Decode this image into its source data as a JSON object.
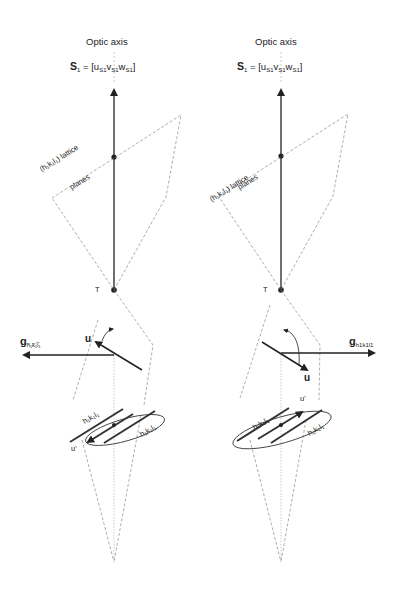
{
  "panels": [
    {
      "id": "left",
      "title": "Optic axis",
      "vector_label": "S",
      "vector_sub": "1",
      "equation": "= [u",
      "eq_parts": [
        "u",
        "S1",
        "v",
        "S1",
        "w",
        "S1"
      ],
      "lattice_label": "(h₁k₁l₁) lattice",
      "lattice_label2": "planes",
      "point_label": "T",
      "g_label": "g",
      "g_sub": "h̅₁k̅₁l̅₁",
      "u_label": "u",
      "u_prime_label": "u'",
      "plane_label_1": "h₁k₁l₁",
      "plane_label_2": "h₁k₁l₁"
    },
    {
      "id": "right",
      "title": "Optic axis",
      "vector_label": "S",
      "vector_sub": "1",
      "eq_parts": [
        "u",
        "S1",
        "v",
        "S1",
        "w",
        "S1"
      ],
      "lattice_label": "(h₁k₁l₁) lattice",
      "lattice_label2": "planes",
      "point_label": "T",
      "g_label": "g",
      "g_sub": "h1k1l1",
      "u_label": "u",
      "u_prime_label": "u'",
      "plane_label_1": "h₁k₁l₁",
      "plane_label_2": "h₁k₁l₁"
    }
  ],
  "colors": {
    "line": "#222222",
    "dashed": "#8a8a8a",
    "text": "#222222"
  }
}
